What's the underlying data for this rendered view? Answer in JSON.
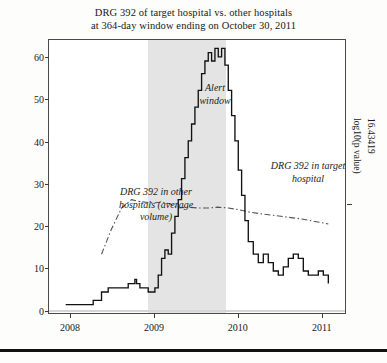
{
  "figure": {
    "title_line1": "DRG 392 of target hospital vs. other hospitals",
    "title_line2": "at 364-day window ending on October 30, 2011"
  },
  "axes": {
    "y_label": "Number of visits (moving sum)",
    "y_ticks": [
      "0",
      "10",
      "20",
      "30",
      "40",
      "50",
      "60"
    ],
    "x_ticks": [
      "2008",
      "2009",
      "2010",
      "2011"
    ],
    "right_label": "log10(p value)",
    "right_value": "16.43419"
  },
  "annotations": {
    "alert_window": "Alert\nwindow",
    "other_hospitals": "DRG 392 in other\nhospitals (average\nvolume)",
    "target_hospital": "DRG 392 in target\nhospital"
  },
  "colors": {
    "target_series": "#111111",
    "other_series": "#555555",
    "alert_band": "#e4e4e4",
    "frame": "#4a4a4a",
    "background": "#ffffff"
  },
  "chart_data": {
    "type": "line",
    "title": "DRG 392 of target hospital vs. other hospitals at 364-day window ending on October 30, 2011",
    "xlabel": "",
    "ylabel": "Number of visits (moving sum)",
    "xlim": [
      2007.75,
      2011.3
    ],
    "ylim": [
      -1,
      64
    ],
    "grid": false,
    "legend": "none (inline annotations)",
    "x_tick_values": [
      2008,
      2009,
      2010,
      2011
    ],
    "y_tick_values": [
      0,
      10,
      20,
      30,
      40,
      50,
      60
    ],
    "right_axis": {
      "label": "log10(p value)",
      "value": 16.43419,
      "tick_at_y": 25
    },
    "shaded_region": {
      "name": "Alert window",
      "x_start": 2008.93,
      "x_end": 2009.86
    },
    "series": [
      {
        "name": "DRG 392 in target hospital",
        "style": "solid",
        "color": "#111111",
        "x": [
          2007.95,
          2008.08,
          2008.2,
          2008.28,
          2008.3,
          2008.38,
          2008.4,
          2008.46,
          2008.5,
          2008.56,
          2008.6,
          2008.64,
          2008.7,
          2008.74,
          2008.78,
          2008.8,
          2008.84,
          2008.88,
          2008.9,
          2008.94,
          2008.98,
          2009.02,
          2009.06,
          2009.1,
          2009.14,
          2009.18,
          2009.22,
          2009.26,
          2009.3,
          2009.34,
          2009.38,
          2009.42,
          2009.46,
          2009.5,
          2009.54,
          2009.58,
          2009.62,
          2009.66,
          2009.7,
          2009.74,
          2009.78,
          2009.82,
          2009.86,
          2009.9,
          2009.94,
          2009.98,
          2010.02,
          2010.06,
          2010.1,
          2010.14,
          2010.2,
          2010.26,
          2010.32,
          2010.38,
          2010.44,
          2010.5,
          2010.56,
          2010.62,
          2010.68,
          2010.74,
          2010.8,
          2010.86,
          2010.92,
          2010.98,
          2011.04,
          2011.1
        ],
        "y": [
          1,
          1,
          1,
          2,
          2,
          4,
          4,
          5,
          5,
          5,
          5,
          5,
          6,
          6,
          7,
          6,
          5,
          5,
          5,
          4,
          4,
          5,
          8,
          12,
          14,
          13,
          18,
          22,
          26,
          31,
          36,
          40,
          44,
          48,
          52,
          56,
          59,
          61,
          59,
          62,
          60,
          62,
          58,
          52,
          46,
          40,
          33,
          27,
          21,
          16,
          13,
          11,
          13,
          11,
          9,
          8,
          10,
          12,
          13,
          12,
          9,
          8,
          8,
          9,
          8,
          6
        ]
      },
      {
        "name": "DRG 392 in other hospitals (average volume)",
        "style": "dash-dot",
        "color": "#555555",
        "x": [
          2008.38,
          2008.5,
          2008.62,
          2008.74,
          2008.82,
          2008.9,
          2009.0,
          2009.1,
          2009.2,
          2009.3,
          2009.42,
          2009.54,
          2009.66,
          2009.78,
          2009.9,
          2010.02,
          2010.16,
          2010.3,
          2010.46,
          2010.62,
          2010.78,
          2010.94,
          2011.1
        ],
        "y": [
          13,
          19,
          24,
          26,
          25.6,
          25.4,
          25.2,
          25.4,
          25,
          24,
          24.2,
          24,
          24,
          24.2,
          24,
          23.6,
          23,
          22.6,
          22.2,
          21.8,
          21.4,
          20.8,
          20.2
        ]
      }
    ]
  }
}
